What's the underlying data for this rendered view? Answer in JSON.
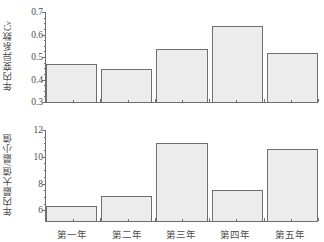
{
  "chart_data": [
    {
      "type": "bar",
      "panel": "top",
      "title": "",
      "xlabel": "",
      "ylabel": "年内变异系数Cv",
      "ylabel_main": "年内变异系数C",
      "ylabel_sub": "v",
      "categories": [
        "第一年",
        "第二年",
        "第三年",
        "第四年",
        "第五年"
      ],
      "values": [
        0.47,
        0.445,
        0.535,
        0.64,
        0.52
      ],
      "ylim": [
        0.3,
        0.7
      ],
      "yticks": [
        0.3,
        0.4,
        0.5,
        0.6,
        0.7
      ],
      "ytick_labels": [
        "0.3",
        "0.4",
        "0.5",
        "0.6",
        "0.7"
      ],
      "minor_ticks_per_interval": 4,
      "grid": false,
      "legend": null,
      "bar_fill": "#ececec",
      "bar_edge": "#6f6f6f"
    },
    {
      "type": "bar",
      "panel": "bottom",
      "title": "",
      "xlabel": "",
      "ylabel": "年内最大值/最小值",
      "ylabel_main": "年内最大值/最小值",
      "ylabel_sub": "",
      "categories": [
        "第一年",
        "第二年",
        "第三年",
        "第四年",
        "第五年"
      ],
      "values": [
        6.35,
        7.1,
        11.0,
        7.55,
        10.6
      ],
      "ylim": [
        5.2,
        12.0
      ],
      "yticks": [
        6,
        8,
        10,
        12
      ],
      "ytick_labels": [
        "6",
        "8",
        "10",
        "12"
      ],
      "minor_ticks_per_interval": 4,
      "grid": false,
      "legend": null,
      "bar_fill": "#ececec",
      "bar_edge": "#6f6f6f"
    }
  ],
  "axis": {
    "categories": [
      "第一年",
      "第二年",
      "第三年",
      "第四年",
      "第五年"
    ]
  }
}
